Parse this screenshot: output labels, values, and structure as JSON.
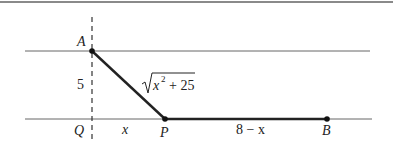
{
  "diagram": {
    "points": {
      "A": {
        "label": "A",
        "x": 92,
        "y": 51
      },
      "Q": {
        "label": "Q",
        "x": 92,
        "y": 119
      },
      "P": {
        "label": "P",
        "x": 165,
        "y": 119
      },
      "B": {
        "label": "B",
        "x": 327,
        "y": 119
      }
    },
    "labels": {
      "vertical_length": "5",
      "hypotenuse_sqrt_base": "x",
      "hypotenuse_exponent": "2",
      "hypotenuse_rest": "+ 25",
      "QP_length": "x",
      "PB_length": "8 − x"
    },
    "colors": {
      "line": "#555555",
      "thick_line": "#222222",
      "border": "#888888"
    }
  }
}
